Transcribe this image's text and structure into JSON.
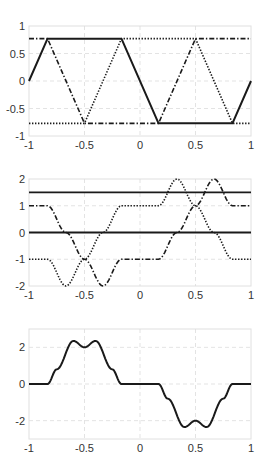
{
  "chart_data": [
    {
      "type": "line",
      "title": "",
      "xlabel": "",
      "ylabel": "",
      "xlim": [
        -1,
        1
      ],
      "ylim": [
        -1,
        1
      ],
      "xticks": [
        -1,
        -0.5,
        0,
        0.5,
        1
      ],
      "xtick_labels": [
        "-1",
        "-0.5",
        "0",
        "0.5",
        "1"
      ],
      "yticks": [
        -1,
        -0.5,
        0,
        0.5,
        1
      ],
      "ytick_labels": [
        "-1",
        "-0.5",
        "0",
        "0.5",
        "1"
      ],
      "grid": true,
      "legend": null,
      "box": {
        "x": 29,
        "y": 26,
        "w": 222,
        "h": 110
      },
      "series": [
        {
          "name": "solid",
          "style": "solid",
          "width": 2,
          "x": [
            -1,
            -0.833,
            -0.167,
            0.167,
            0.833,
            1
          ],
          "y": [
            0,
            0.77,
            0.77,
            -0.77,
            -0.77,
            0
          ]
        },
        {
          "name": "dotted",
          "style": "dotted",
          "width": 1.6,
          "x": [
            -1,
            -0.5,
            -0.167,
            0.5,
            0.833,
            1
          ],
          "y": [
            -0.77,
            -0.77,
            0.77,
            0.77,
            -0.77,
            -0.77
          ]
        },
        {
          "name": "dash-dot",
          "style": "dashdot",
          "width": 1.6,
          "x": [
            -1,
            -0.833,
            -0.5,
            0.167,
            0.5,
            1
          ],
          "y": [
            0.77,
            0.77,
            -0.77,
            -0.77,
            0.77,
            0.77
          ]
        }
      ]
    },
    {
      "type": "line",
      "title": "",
      "xlabel": "",
      "ylabel": "",
      "xlim": [
        -1,
        1
      ],
      "ylim": [
        -2,
        2
      ],
      "xticks": [
        -1,
        -0.5,
        0,
        0.5,
        1
      ],
      "xtick_labels": [
        "-1",
        "-0.5",
        "0",
        "0.5",
        "1"
      ],
      "yticks": [
        -2,
        -1,
        0,
        1,
        2
      ],
      "ytick_labels": [
        "-2",
        "-1",
        "0",
        "1",
        "2"
      ],
      "grid": true,
      "legend": null,
      "box": {
        "x": 29,
        "y": 179,
        "w": 222,
        "h": 107
      },
      "series": [
        {
          "name": "solid-upper",
          "style": "solid",
          "width": 1.8,
          "x": [
            -1,
            1
          ],
          "y": [
            1.5,
            1.5
          ]
        },
        {
          "name": "solid-zero",
          "style": "solid",
          "width": 1.8,
          "x": [
            -1,
            1
          ],
          "y": [
            0,
            0
          ]
        },
        {
          "name": "dotted",
          "style": "dotted",
          "width": 1.6,
          "smooth": true,
          "x": [
            -1,
            -0.833,
            -0.667,
            -0.5,
            -0.333,
            -0.167,
            0.167,
            0.333,
            0.5,
            0.667,
            0.833,
            1
          ],
          "y": [
            -1,
            -1,
            -2,
            -1,
            0,
            1,
            1,
            2,
            1,
            0,
            -1,
            -1
          ]
        },
        {
          "name": "dash-dot",
          "style": "dashdot",
          "width": 1.6,
          "smooth": true,
          "x": [
            -1,
            -0.833,
            -0.667,
            -0.5,
            -0.333,
            -0.167,
            0.167,
            0.333,
            0.5,
            0.667,
            0.833,
            1
          ],
          "y": [
            1,
            1,
            0,
            -1,
            -2,
            -1,
            -1,
            0,
            1,
            2,
            1,
            1
          ]
        }
      ]
    },
    {
      "type": "line",
      "title": "",
      "xlabel": "",
      "ylabel": "",
      "xlim": [
        -1,
        1
      ],
      "ylim": [
        -3,
        3
      ],
      "xticks": [
        -1,
        -0.5,
        0,
        0.5,
        1
      ],
      "xtick_labels": [
        "-1",
        "-0.5",
        "0",
        "0.5",
        "1"
      ],
      "yticks": [
        -2,
        0,
        2
      ],
      "ytick_labels": [
        "-2",
        "0",
        "2"
      ],
      "grid": true,
      "legend": null,
      "box": {
        "x": 29,
        "y": 329,
        "w": 222,
        "h": 110
      },
      "series": [
        {
          "name": "solid",
          "style": "solid",
          "width": 2,
          "smooth": true,
          "x": [
            -1,
            -0.833,
            -0.75,
            -0.6,
            -0.5,
            -0.4,
            -0.25,
            -0.167,
            0.167,
            0.25,
            0.4,
            0.5,
            0.6,
            0.75,
            0.833,
            1
          ],
          "y": [
            0,
            0,
            0.8,
            2.35,
            2.0,
            2.35,
            0.8,
            0,
            0,
            -0.8,
            -2.35,
            -2.0,
            -2.35,
            -0.8,
            0,
            0
          ]
        }
      ]
    }
  ]
}
